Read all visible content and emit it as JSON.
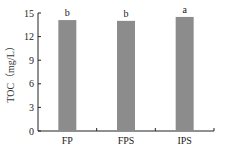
{
  "chart_data": {
    "type": "bar",
    "title": "",
    "xlabel": "",
    "ylabel": "TOC（mg/L）",
    "categories": [
      "FP",
      "FPS",
      "IPS"
    ],
    "values": [
      14.1,
      14.0,
      14.5
    ],
    "significance_letters": [
      "b",
      "b",
      "a"
    ],
    "ylim": [
      0,
      15
    ],
    "yticks": [
      0,
      3,
      6,
      9,
      12,
      15
    ],
    "grid": false,
    "legend": null,
    "bar_color": "#8c8c8c"
  }
}
